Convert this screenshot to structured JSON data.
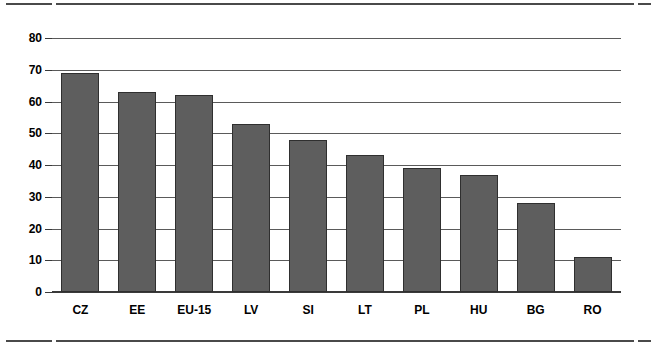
{
  "chart_data": {
    "type": "bar",
    "title": "",
    "subtitle": "",
    "xlabel": "",
    "ylabel": "",
    "categories": [
      "CZ",
      "EE",
      "EU-15",
      "LV",
      "SI",
      "LT",
      "PL",
      "HU",
      "BG",
      "RO"
    ],
    "values": [
      69,
      63,
      62,
      53,
      48,
      43,
      39,
      37,
      28,
      11
    ],
    "ylim": [
      0,
      80
    ],
    "ytick_step": 10,
    "yticks": [
      0,
      10,
      20,
      30,
      40,
      50,
      60,
      70,
      80
    ],
    "ytick_labels": [
      "0",
      "10",
      "20",
      "30",
      "40",
      "50",
      "60",
      "70",
      "80"
    ],
    "grid": true,
    "grid_axis": "y",
    "legend": false,
    "legend_position": "none",
    "bar_color": "#5e5e5e",
    "bar_edge_color": "#2f2f2f",
    "gridline_color": "#5a5a5a",
    "axis_color": "#3a3a3a",
    "rule_color": "#4a4a4a",
    "background_color": "#ffffff"
  }
}
